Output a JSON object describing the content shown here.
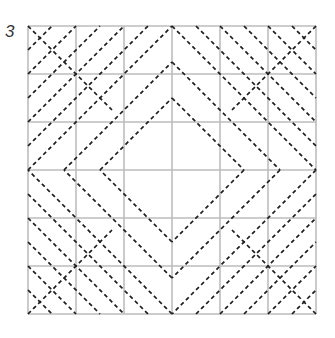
{
  "figure": {
    "label": "3",
    "grid": {
      "origin_px": [
        28,
        26
      ],
      "cell_px": 48,
      "cells": 6,
      "grid_color": "#bdbdbd",
      "dash_color": "#1e1e1e"
    },
    "diamonds": [
      {
        "name": "outer",
        "half_size": 3
      },
      {
        "name": "middle",
        "half_size": 2.25
      },
      {
        "name": "inner",
        "half_size": 1.5
      }
    ],
    "corner_lines": {
      "top_left_anti_diagonals": [
        0.5,
        1,
        1.5,
        2,
        2.5
      ],
      "top_right_diagonals": [
        3.5,
        4,
        4.5,
        5,
        5.5
      ],
      "bottom_left_diagonals": [
        3.5,
        4,
        4.5,
        5,
        5.5
      ],
      "bottom_right_anti_diagonals": [
        9.5,
        10,
        10.5,
        11,
        11.5
      ]
    },
    "corner_segments": [
      {
        "corner": "top-left",
        "from": [
          0,
          0
        ],
        "to": [
          1.75,
          1.75
        ]
      },
      {
        "corner": "top-right",
        "from": [
          6,
          0
        ],
        "to": [
          4.25,
          1.75
        ]
      },
      {
        "corner": "bottom-left",
        "from": [
          0,
          6
        ],
        "to": [
          1.75,
          4.25
        ]
      },
      {
        "corner": "bottom-right",
        "from": [
          6,
          6
        ],
        "to": [
          4.25,
          4.25
        ]
      }
    ]
  }
}
